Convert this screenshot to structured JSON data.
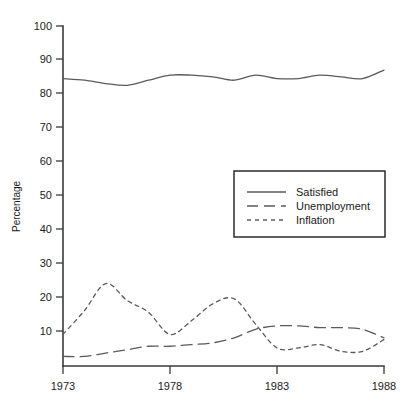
{
  "chart_data": {
    "type": "line",
    "title": "",
    "subtitle": "",
    "xlabel": "",
    "ylabel": "Percentage",
    "xlim": [
      1973,
      1988
    ],
    "ylim": [
      0,
      100
    ],
    "x_ticks": [
      1973,
      1978,
      1983,
      1988
    ],
    "y_ticks": [
      10,
      20,
      30,
      40,
      50,
      60,
      70,
      80,
      90,
      100
    ],
    "grid": false,
    "legend_position": "center-right",
    "x": [
      1973,
      1974,
      1975,
      1976,
      1977,
      1978,
      1979,
      1980,
      1981,
      1982,
      1983,
      1984,
      1985,
      1986,
      1987,
      1988
    ],
    "series": [
      {
        "name": "Satisfied",
        "style": "solid",
        "color": "#5a5a5a",
        "values": [
          84.5,
          84.0,
          83.0,
          82.5,
          84.0,
          85.5,
          85.5,
          85.0,
          84.0,
          85.5,
          84.5,
          84.5,
          85.5,
          85.0,
          84.5,
          87.0
        ]
      },
      {
        "name": "Unemployment",
        "style": "long-dash",
        "color": "#5a5a5a",
        "values": [
          2.5,
          2.5,
          3.5,
          4.5,
          5.5,
          5.5,
          6.0,
          6.5,
          8.0,
          10.5,
          11.5,
          11.5,
          11.0,
          11.0,
          10.5,
          8.0
        ]
      },
      {
        "name": "Inflation",
        "style": "short-dash",
        "color": "#5a5a5a",
        "values": [
          9.0,
          16.0,
          24.0,
          19.0,
          15.5,
          9.0,
          13.0,
          18.0,
          19.5,
          12.0,
          5.0,
          5.0,
          6.0,
          4.0,
          4.0,
          7.5
        ]
      }
    ]
  },
  "legend": {
    "entries": [
      {
        "label": "Satisfied",
        "style": "solid"
      },
      {
        "label": "Unemployment",
        "style": "long-dash"
      },
      {
        "label": "Inflation",
        "style": "short-dash"
      }
    ]
  },
  "axes": {
    "y_title": "Percentage",
    "y_tick_labels": [
      "100",
      "90",
      "80",
      "70",
      "60",
      "50",
      "40",
      "30",
      "20",
      "10"
    ],
    "x_tick_labels": [
      "1973",
      "1978",
      "1983",
      "1988"
    ]
  },
  "colors": {
    "line": "#5a5a5a",
    "axis": "#3a3a3a",
    "text": "#1a1a1a",
    "background": "#ffffff"
  }
}
